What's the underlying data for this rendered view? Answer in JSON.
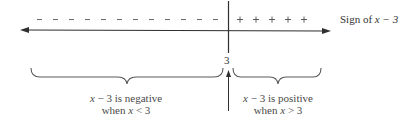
{
  "diagram": {
    "type": "sign-chart-number-line",
    "critical_point": "3",
    "axis_label": {
      "prefix": "Sign of ",
      "expr": "x − 3"
    },
    "negative_signs": [
      "−",
      "−",
      "−",
      "−",
      "−",
      "−",
      "−",
      "−",
      "−",
      "−",
      "−",
      "−"
    ],
    "positive_signs": [
      "+",
      "+",
      "+",
      "+",
      "+"
    ],
    "left_region": {
      "line1_var": "x",
      "line1_rest": " − 3 is negative",
      "line2_pre": "when ",
      "line2_var": "x",
      "line2_rest": " < 3"
    },
    "right_region": {
      "line1_var": "x",
      "line1_rest": " − 3 is positive",
      "line2_pre": "when ",
      "line2_var": "x",
      "line2_rest": " > 3"
    },
    "colors": {
      "line": "#2f2f2f",
      "text": "#4a4a4a",
      "signs": "#5a5a5a"
    }
  }
}
